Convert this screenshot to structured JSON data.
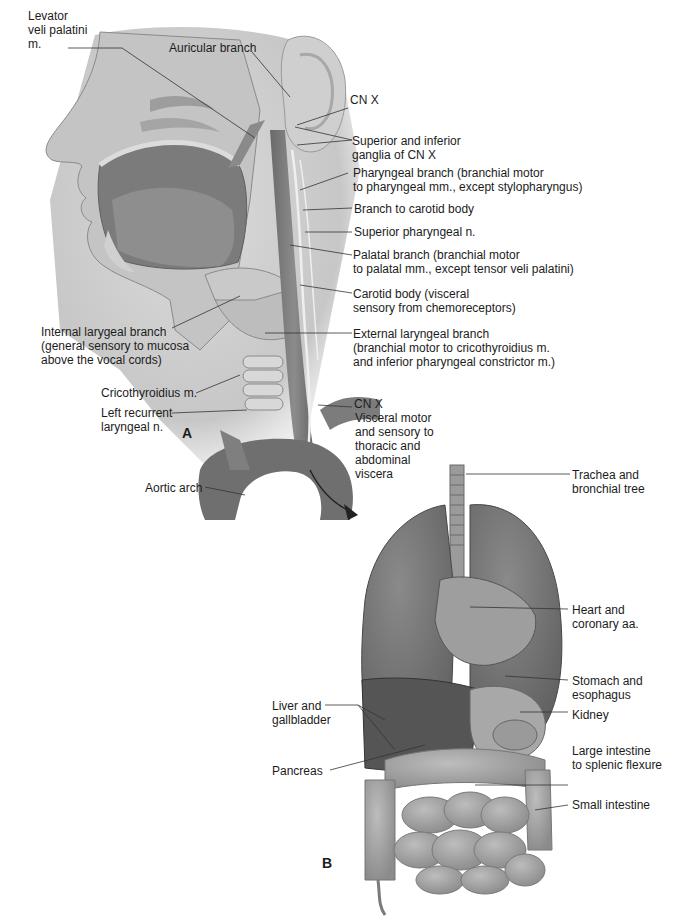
{
  "figure": {
    "panels": [
      {
        "id": "A",
        "label": "A",
        "subject": "Head and neck, vagus nerve (CN X) branches"
      },
      {
        "id": "B",
        "label": "B",
        "subject": "Thoracic and abdominal viscera"
      }
    ]
  },
  "labels": {
    "levator": "Levator\nveli palatini\nm.",
    "auricular": "Auricular branch",
    "cnx_top": "CN X",
    "ganglia": "Superior and inferior\nganglia of CN X",
    "pharyngeal_branch": "Pharyngeal branch (branchial motor\nto pharyngeal mm., except stylopharyngus)",
    "carotid_branch": "Branch to carotid body",
    "sup_pharyngeal": "Superior pharyngeal n.",
    "palatal_branch": "Palatal branch (branchial motor\nto palatal mm., except tensor veli palatini)",
    "carotid_body": "Carotid body (visceral\nsensory from chemoreceptors)",
    "internal_laryngeal": "Internal larygeal branch\n(general sensory to mucosa\nabove the vocal cords)",
    "external_laryngeal": "External laryngeal branch\n(branchial motor to cricothyroidius m.\nand inferior pharyngeal constrictor m.)",
    "cricothyroidius": "Cricothyroidius m.",
    "left_recurrent": "Left recurrent\nlaryngeal n.",
    "cnx_bottom": "CN X",
    "visceral_motor": "Visceral motor\nand sensory to\nthoracic and\nabdominal\nviscera",
    "aortic_arch": "Aortic arch",
    "trachea": "Trachea and\nbronchial tree",
    "heart": "Heart and\ncoronary aa.",
    "stomach": "Stomach and\nesophagus",
    "liver": "Liver and\ngallbladder",
    "kidney": "Kidney",
    "pancreas": "Pancreas",
    "large_intestine": "Large intestine\nto splenic flexure",
    "small_intestine": "Small intestine"
  },
  "colors": {
    "tissue_light": "#d9d9d9",
    "tissue_mid": "#9a9a9a",
    "tissue_dark": "#6e6e6e",
    "vessel": "#7a7a7a",
    "nerve": "#efefef",
    "leader": "#333333"
  }
}
